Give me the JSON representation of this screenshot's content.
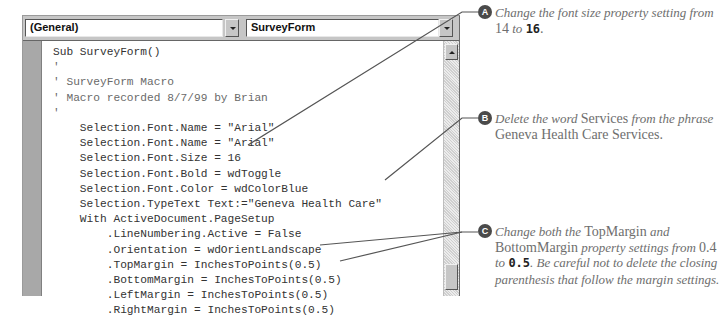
{
  "vba_editor": {
    "object_combo": {
      "value": "(General)"
    },
    "procedure_combo": {
      "value": "SurveyForm"
    },
    "code_lines": [
      {
        "text": "Sub SurveyForm()",
        "type": "code"
      },
      {
        "text": "'",
        "type": "comment"
      },
      {
        "text": "' SurveyForm Macro",
        "type": "comment"
      },
      {
        "text": "' Macro recorded 8/7/99 by Brian",
        "type": "comment"
      },
      {
        "text": "'",
        "type": "comment"
      },
      {
        "text": "    Selection.Font.Name = \"Arial\"",
        "type": "code"
      },
      {
        "text": "    Selection.Font.Name = \"Arial\"",
        "type": "code"
      },
      {
        "text": "    Selection.Font.Size = 16",
        "type": "code"
      },
      {
        "text": "    Selection.Font.Bold = wdToggle",
        "type": "code"
      },
      {
        "text": "    Selection.Font.Color = wdColorBlue",
        "type": "code"
      },
      {
        "text": "    Selection.TypeText Text:=\"Geneva Health Care\"",
        "type": "code"
      },
      {
        "text": "    With ActiveDocument.PageSetup",
        "type": "code"
      },
      {
        "text": "        .LineNumbering.Active = False",
        "type": "code"
      },
      {
        "text": "        .Orientation = wdOrientLandscape",
        "type": "code"
      },
      {
        "text": "        .TopMargin = InchesToPoints(0.5)",
        "type": "code"
      },
      {
        "text": "        .BottomMargin = InchesToPoints(0.5)",
        "type": "code"
      },
      {
        "text": "        .LeftMargin = InchesToPoints(0.5)",
        "type": "code"
      },
      {
        "text": "        .RightMargin = InchesToPoints(0.5)",
        "type": "code"
      }
    ]
  },
  "callouts": [
    {
      "badge": "A",
      "parts": [
        {
          "t": "Change the font size property setting from ",
          "s": "it"
        },
        {
          "t": "14",
          "s": "rm"
        },
        {
          "t": " to ",
          "s": "it"
        },
        {
          "t": "16",
          "s": "bd"
        },
        {
          "t": ".",
          "s": "rm"
        }
      ]
    },
    {
      "badge": "B",
      "parts": [
        {
          "t": "Delete the word ",
          "s": "it"
        },
        {
          "t": "Services",
          "s": "rm"
        },
        {
          "t": " from the phrase ",
          "s": "it"
        },
        {
          "t": "Geneva Health Care Services.",
          "s": "rm"
        }
      ]
    },
    {
      "badge": "C",
      "parts": [
        {
          "t": "Change both the ",
          "s": "it"
        },
        {
          "t": "TopMargin",
          "s": "rm"
        },
        {
          "t": " and ",
          "s": "it"
        },
        {
          "t": "BottomMargin",
          "s": "rm"
        },
        {
          "t": " property settings from ",
          "s": "it"
        },
        {
          "t": "0.4",
          "s": "rm"
        },
        {
          "t": " to ",
          "s": "it"
        },
        {
          "t": "0.5",
          "s": "bd"
        },
        {
          "t": ". Be careful not to delete the closing parenthesis that follow the margin settings.",
          "s": "it"
        }
      ]
    }
  ],
  "colors": {
    "leader_line": "#555555",
    "badge": "#4a4a4a",
    "callout_text": "#6e6e6e"
  }
}
